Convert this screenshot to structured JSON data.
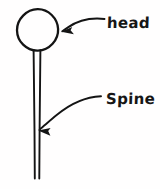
{
  "diagram": {
    "background_color": "#fffefe",
    "ink_color": "#141414",
    "labels": {
      "head": "head",
      "spine": "Spine"
    },
    "shapes": {
      "head_circle": {
        "name": "head-circle",
        "center_x": 37.5,
        "center_y": 30,
        "radius": 20.5
      },
      "spine_tube": {
        "name": "spine-tube",
        "top_y": 50,
        "bottom_y": 179,
        "left_x": 34,
        "right_x": 39.5
      }
    },
    "annotations": [
      {
        "name": "head-arrow",
        "points_to": "head-circle",
        "tail_x": 105,
        "tail_y": 19,
        "tip_x": 62,
        "tip_y": 31
      },
      {
        "name": "spine-arrow",
        "points_to": "spine-tube",
        "tail_x": 101,
        "tail_y": 96,
        "tip_x": 38,
        "tip_y": 130
      }
    ]
  }
}
